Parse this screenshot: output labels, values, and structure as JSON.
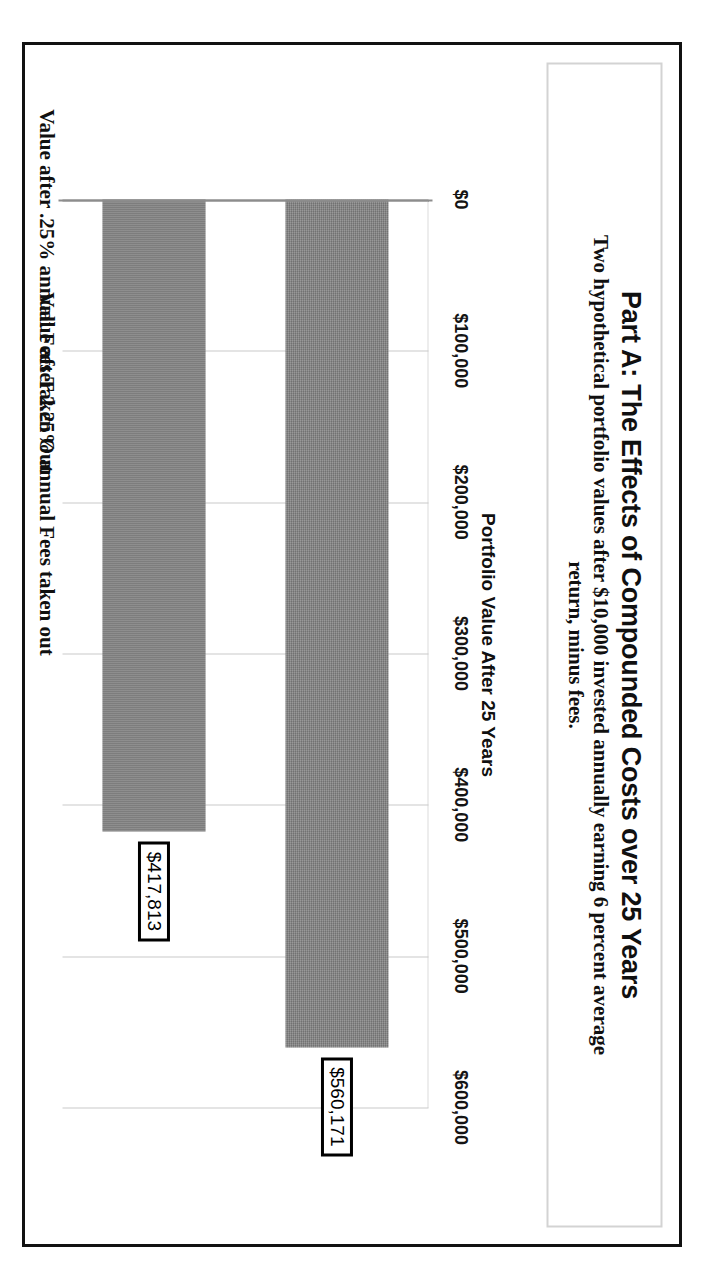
{
  "chart_data": {
    "type": "bar",
    "orientation": "horizontal",
    "title": "Part A:  The Effects of Compounded Costs over 25 Years",
    "subtitle": "Two hypothetical portfolio values after $10,000 invested annually earning 6 percent average return, minus fees.",
    "xlabel": "Portfolio Value After 25 Years",
    "ylabel": "",
    "categories": [
      "Value after .25% annual Fees Taken Out",
      "Value after 2.25% annual Fees taken out"
    ],
    "values": [
      560171,
      417813
    ],
    "value_labels": [
      "$560,171",
      "$417,813"
    ],
    "tick_values": [
      0,
      100000,
      200000,
      300000,
      400000,
      500000,
      600000
    ],
    "tick_labels": [
      "$0",
      "$100,000",
      "$200,000",
      "$300,000",
      "$400,000",
      "$500,000",
      "$600,000"
    ],
    "xlim": [
      0,
      600000
    ],
    "grid": true,
    "legend": false,
    "series_color": "#8b8b8b"
  },
  "figure": {
    "frame_color": "#111111",
    "title_box_border": "#d3d3d3",
    "background": "#ffffff"
  }
}
